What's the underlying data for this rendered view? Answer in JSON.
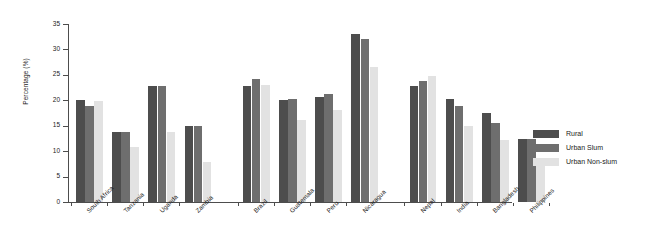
{
  "chart_data": {
    "type": "bar",
    "title": "",
    "xlabel": "",
    "ylabel": "Percentage (%)",
    "ylim": [
      0,
      35
    ],
    "yticks": [
      0,
      5,
      10,
      15,
      20,
      25,
      30,
      35
    ],
    "grid": false,
    "legend_position": "right",
    "categories": [
      "South Africa",
      "Tanzania",
      "Uganda",
      "Zambia",
      "Brazil",
      "Guatemala",
      "Peru",
      "Nicaragua",
      "Nepal",
      "India",
      "Bangladesh",
      "Philippines"
    ],
    "group_breaks": [
      4,
      8
    ],
    "series": [
      {
        "name": "Rural",
        "color": "#4d4d4d",
        "values": [
          20.0,
          13.8,
          22.9,
          15.0,
          22.9,
          20.0,
          20.7,
          33.0,
          22.9,
          20.3,
          17.5,
          12.3
        ]
      },
      {
        "name": "Urban Slum",
        "color": "#6e6e6e",
        "values": [
          18.8,
          13.8,
          22.9,
          15.0,
          24.2,
          20.2,
          21.2,
          32.0,
          23.8,
          18.8,
          15.5,
          12.3
        ]
      },
      {
        "name": "Urban Non-slum",
        "color": "#e2e2e2",
        "values": [
          19.8,
          10.8,
          13.8,
          7.8,
          23.0,
          16.2,
          18.0,
          26.5,
          24.7,
          15.0,
          12.2,
          7.0
        ]
      }
    ]
  },
  "legend": {
    "items": [
      {
        "label": "Rural",
        "color": "#4d4d4d"
      },
      {
        "label": "Urban Slum",
        "color": "#6e6e6e"
      },
      {
        "label": "Urban Non-slum",
        "color": "#e2e2e2"
      }
    ]
  }
}
